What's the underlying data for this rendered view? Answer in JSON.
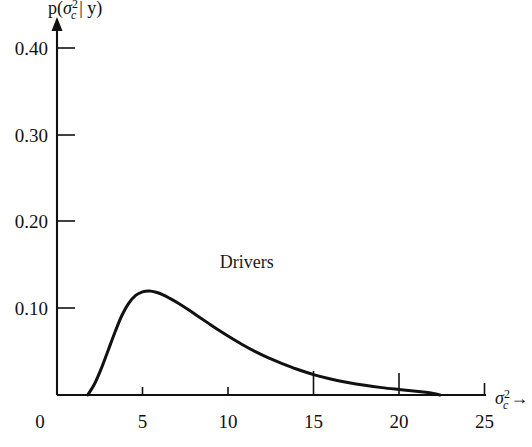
{
  "chart_data": {
    "type": "line",
    "title": "",
    "xlabel": "sigma_c^2",
    "xlabel_display": "σ",
    "xlabel_sup": "2",
    "xlabel_sub": "c",
    "xlabel_arrow": "→",
    "ylabel": "p(sigma_c^2 | y)",
    "ylabel_p": "p(",
    "ylabel_sigma": "σ",
    "ylabel_sup": "2",
    "ylabel_sub": "c",
    "ylabel_bar": "| y)",
    "xlim": [
      0,
      25
    ],
    "ylim": [
      0,
      0.44
    ],
    "xticks": [
      0,
      5,
      10,
      15,
      20,
      25
    ],
    "xticklabels": [
      "0",
      "5",
      "10",
      "15",
      "20",
      "25"
    ],
    "yticks": [
      0.1,
      0.2,
      0.3,
      0.4
    ],
    "yticklabels": [
      "0.10",
      "0.20",
      "0.30",
      "0.40"
    ],
    "grid": false,
    "legend": null,
    "annotations": [
      {
        "text": "Drivers",
        "x": 11.1,
        "y": 0.147
      }
    ],
    "series": [
      {
        "name": "Drivers",
        "color": "#111111",
        "x": [
          1.8,
          2.2,
          2.6,
          3.0,
          3.4,
          3.8,
          4.2,
          4.6,
          5.0,
          5.4,
          5.8,
          6.2,
          6.6,
          7.0,
          7.6,
          8.2,
          8.8,
          9.4,
          10.0,
          10.8,
          11.6,
          12.4,
          13.2,
          14.0,
          15.0,
          16.0,
          17.0,
          18.0,
          19.0,
          20.0,
          21.0,
          22.0,
          22.4
        ],
        "y": [
          0.0,
          0.013,
          0.031,
          0.052,
          0.073,
          0.092,
          0.106,
          0.115,
          0.119,
          0.12,
          0.1185,
          0.1155,
          0.1115,
          0.107,
          0.0995,
          0.0915,
          0.0835,
          0.0755,
          0.068,
          0.0585,
          0.05,
          0.0425,
          0.036,
          0.03,
          0.0235,
          0.0185,
          0.0145,
          0.0112,
          0.0085,
          0.0063,
          0.0042,
          0.0018,
          0.0
        ]
      }
    ]
  },
  "axes_geometry": {
    "plot_left_px": 57,
    "plot_bottom_px": 395,
    "px_per_x_unit": 17.1,
    "px_per_y_unit": 866.7,
    "y_axis_top_px": 20,
    "x_axis_right_px": 486
  }
}
